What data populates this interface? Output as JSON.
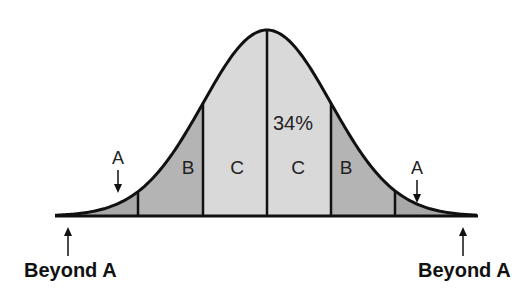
{
  "diagram": {
    "type": "normal-distribution",
    "regions": [
      {
        "label": "A",
        "side": "left",
        "fill": "#a8a8a8"
      },
      {
        "label": "B",
        "side": "left",
        "fill": "#b4b4b4"
      },
      {
        "label": "C",
        "side": "left",
        "fill": "#d9d9d9"
      },
      {
        "label": "C",
        "side": "right",
        "fill": "#d9d9d9"
      },
      {
        "label": "B",
        "side": "right",
        "fill": "#b4b4b4"
      },
      {
        "label": "A",
        "side": "right",
        "fill": "#a8a8a8"
      }
    ],
    "percent_label": "34%",
    "tail_labels": {
      "left": "Beyond A",
      "right": "Beyond A"
    },
    "colors": {
      "outline": "#111111",
      "light_fill": "#d9d9d9",
      "mid_fill": "#b4b4b4",
      "dark_fill": "#a8a8a8"
    }
  }
}
